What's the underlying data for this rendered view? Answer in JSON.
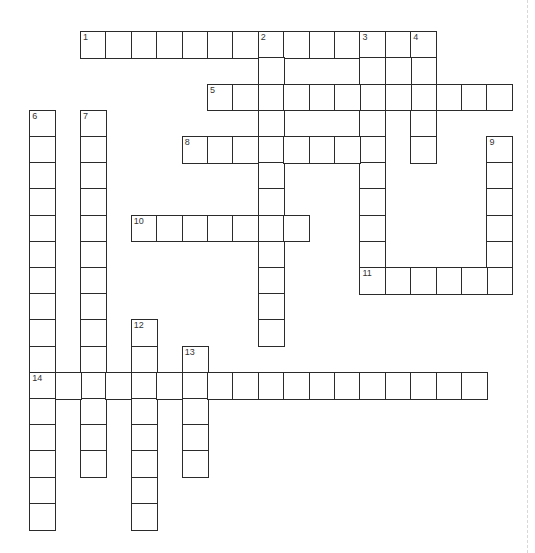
{
  "puzzle": {
    "type": "crossword",
    "grid_size": {
      "cols": 19,
      "rows": 19
    },
    "layout": {
      "origin_x": 30,
      "origin_y": 32,
      "cell_w": 25.4,
      "cell_h": 26.2
    },
    "colors": {
      "border": "#2b2b2b",
      "cell": "#ffffff",
      "number": "#333333"
    },
    "words": [
      {
        "number": "1",
        "direction": "across",
        "row": 0,
        "col": 2,
        "length": 14
      },
      {
        "number": "2",
        "direction": "down",
        "row": 0,
        "col": 9,
        "length": 12
      },
      {
        "number": "3",
        "direction": "down",
        "row": 0,
        "col": 13,
        "length": 10
      },
      {
        "number": "4",
        "direction": "down",
        "row": 0,
        "col": 15,
        "length": 5
      },
      {
        "number": "5",
        "direction": "across",
        "row": 2,
        "col": 7,
        "length": 12
      },
      {
        "number": "6",
        "direction": "down",
        "row": 3,
        "col": 0,
        "length": 16
      },
      {
        "number": "7",
        "direction": "down",
        "row": 3,
        "col": 2,
        "length": 14
      },
      {
        "number": "8",
        "direction": "across",
        "row": 4,
        "col": 6,
        "length": 8
      },
      {
        "number": "9",
        "direction": "down",
        "row": 4,
        "col": 18,
        "length": 6
      },
      {
        "number": "10",
        "direction": "across",
        "row": 7,
        "col": 4,
        "length": 7
      },
      {
        "number": "11",
        "direction": "across",
        "row": 9,
        "col": 13,
        "length": 6
      },
      {
        "number": "12",
        "direction": "down",
        "row": 11,
        "col": 4,
        "length": 8
      },
      {
        "number": "13",
        "direction": "down",
        "row": 12,
        "col": 6,
        "length": 5
      },
      {
        "number": "14",
        "direction": "across",
        "row": 13,
        "col": 0,
        "length": 18
      }
    ],
    "extra_cells": [
      {
        "row": 1,
        "col": 14
      }
    ]
  }
}
